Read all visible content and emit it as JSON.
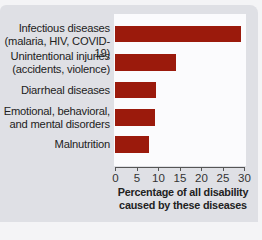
{
  "chart_data": {
    "type": "bar",
    "orientation": "horizontal",
    "title": "",
    "categories": [
      "Infectious diseases (malaria, HIV, COVID-19)",
      "Unintentional injuries (accidents, violence)",
      "Diarrheal diseases",
      "Emotional, behavioral, and mental disorders",
      "Malnutrition"
    ],
    "category_lines": [
      [
        "Infectious diseases",
        "(malaria, HIV, COVID-19)"
      ],
      [
        "Unintentional injuries",
        "(accidents, violence)"
      ],
      [
        "Diarrheal diseases"
      ],
      [
        "Emotional, behavioral,",
        "and mental disorders"
      ],
      [
        "Malnutrition"
      ]
    ],
    "values": [
      29.3,
      14.2,
      9.6,
      9.2,
      8.0
    ],
    "xlabel": "Percentage of all disability caused by these diseases",
    "xlabel_lines": [
      "Percentage of all disability",
      "caused by these diseases"
    ],
    "ylabel": "",
    "xlim": [
      0,
      30
    ],
    "xticks": [
      "0",
      "5",
      "10",
      "15",
      "20",
      "25",
      "30"
    ],
    "grid": false,
    "legend": null,
    "colors": {
      "bar": "#9b1a0c",
      "panel": "#dfe0e5",
      "plot_bg": "#fbfbfd"
    }
  }
}
